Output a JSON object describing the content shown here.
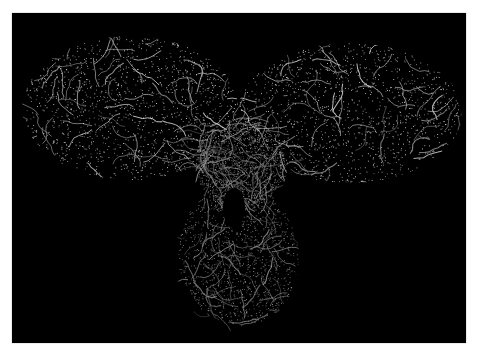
{
  "scene": {
    "background_color": "#000000",
    "page_background": "#ffffff",
    "subject": "antibody-molecular-surface-mesh",
    "mesh_color": "#e8e8e8",
    "regions": [
      {
        "name": "left-fab-lobe",
        "cx": 118,
        "cy": 95,
        "rx": 108,
        "ry": 72
      },
      {
        "name": "right-fab-lobe",
        "cx": 338,
        "cy": 100,
        "rx": 112,
        "ry": 70
      },
      {
        "name": "hinge",
        "cx": 228,
        "cy": 150,
        "rx": 45,
        "ry": 45
      },
      {
        "name": "fc-stem",
        "cx": 228,
        "cy": 240,
        "rx": 62,
        "ry": 72
      }
    ]
  }
}
